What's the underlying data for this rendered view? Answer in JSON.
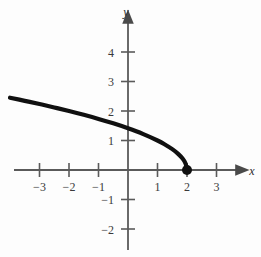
{
  "figure": {
    "background_color": "#fdfdfd",
    "axis_color": "#5a5a5a",
    "curve_color": "#101010",
    "text_color": "#3a3a3a"
  },
  "labels": {
    "x_axis": "x",
    "y_axis": "y"
  },
  "chart_data": {
    "type": "line",
    "title": "",
    "xlabel": "x",
    "ylabel": "y",
    "xlim": [
      -4.0,
      4.4
    ],
    "ylim": [
      -2.8,
      4.8
    ],
    "grid": false,
    "legend": "none",
    "equation": "y = sqrt(2 - x)",
    "x_ticks": [
      -3,
      -2,
      -1,
      1,
      2,
      3
    ],
    "x_tick_labels": [
      "−3",
      "−2",
      "−1",
      "1",
      "2",
      "3"
    ],
    "y_ticks": [
      -2,
      -1,
      1,
      2,
      3,
      4
    ],
    "y_tick_labels": [
      "−2",
      "−1",
      "1",
      "2",
      "3",
      "4"
    ],
    "series": [
      {
        "name": "y = sqrt(2 - x)",
        "x": [
          -4.0,
          -3.5,
          -3.0,
          -2.5,
          -2.0,
          -1.5,
          -1.0,
          -0.5,
          0.0,
          0.5,
          1.0,
          1.25,
          1.5,
          1.7,
          1.85,
          1.95,
          2.0
        ],
        "values": [
          2.449,
          2.345,
          2.236,
          2.121,
          2.0,
          1.871,
          1.732,
          1.581,
          1.414,
          1.225,
          1.0,
          0.866,
          0.707,
          0.548,
          0.387,
          0.224,
          0.0
        ]
      }
    ],
    "points": [
      {
        "name": "endpoint",
        "x": 2,
        "y": 0,
        "style": "filled-circle",
        "label": ""
      }
    ],
    "y_intercept": 1.414,
    "x_intercept": 2
  }
}
